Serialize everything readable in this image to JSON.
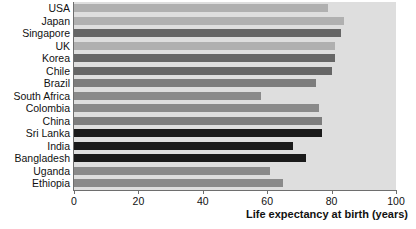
{
  "chart_data": {
    "type": "bar",
    "orientation": "horizontal",
    "title": "",
    "xlabel": "Life expectancy at birth (years)",
    "ylabel": "",
    "xlim": [
      0,
      100
    ],
    "xticks": [
      0,
      20,
      40,
      60,
      80,
      100
    ],
    "grid": false,
    "legend": "none",
    "plot_background": "#dedede",
    "categories": [
      "USA",
      "Japan",
      "Singapore",
      "UK",
      "Korea",
      "Chile",
      "Brazil",
      "South Africa",
      "Colombia",
      "China",
      "Sri Lanka",
      "India",
      "Bangladesh",
      "Uganda",
      "Ethiopia"
    ],
    "values": [
      79,
      84,
      83,
      81,
      81,
      80,
      75,
      58,
      76,
      77,
      77,
      68,
      72,
      61,
      65
    ],
    "bar_colors": [
      "#b0b0b0",
      "#b0b0b0",
      "#666666",
      "#b0b0b0",
      "#666666",
      "#666666",
      "#7d7d7d",
      "#8a8a8a",
      "#8a8a8a",
      "#7d7d7d",
      "#1a1a1a",
      "#1a1a1a",
      "#1a1a1a",
      "#8a8a8a",
      "#8a8a8a"
    ]
  }
}
